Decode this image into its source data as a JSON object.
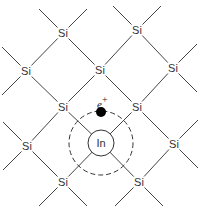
{
  "diagram": {
    "atoms": [
      {
        "label": "Si",
        "x": 63,
        "y": 33
      },
      {
        "label": "Si",
        "x": 137,
        "y": 30
      },
      {
        "label": "Si",
        "x": 26,
        "y": 71
      },
      {
        "label": "Si",
        "x": 100,
        "y": 70
      },
      {
        "label": "Si",
        "x": 173,
        "y": 68
      },
      {
        "label": "Si",
        "x": 63,
        "y": 107
      },
      {
        "label": "Si",
        "x": 137,
        "y": 107
      },
      {
        "label": "Si",
        "x": 27,
        "y": 146
      },
      {
        "label": "Si",
        "x": 174,
        "y": 144
      },
      {
        "label": "Si",
        "x": 63,
        "y": 182
      },
      {
        "label": "Si",
        "x": 139,
        "y": 182
      }
    ],
    "impurity": {
      "label": "In",
      "x": 101,
      "y": 143,
      "r": 13
    },
    "orbit": {
      "x": 101,
      "y": 143,
      "r": 32,
      "style": "dashed"
    },
    "carrier": {
      "label": "e",
      "charge": "+",
      "x": 101,
      "y": 112,
      "r": 5
    }
  }
}
